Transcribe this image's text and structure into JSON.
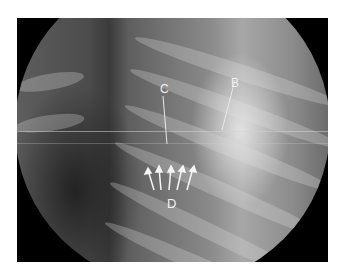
{
  "image": {
    "description": "Fluoroscopic chest X-ray in a circular field of view with annotations",
    "labels": {
      "b": "B",
      "c": "C",
      "d": "D"
    },
    "arrow_count_d": 5,
    "colors": {
      "background": "#ffffff",
      "mask": "#000000",
      "annotation": "#f2f2f2"
    }
  }
}
